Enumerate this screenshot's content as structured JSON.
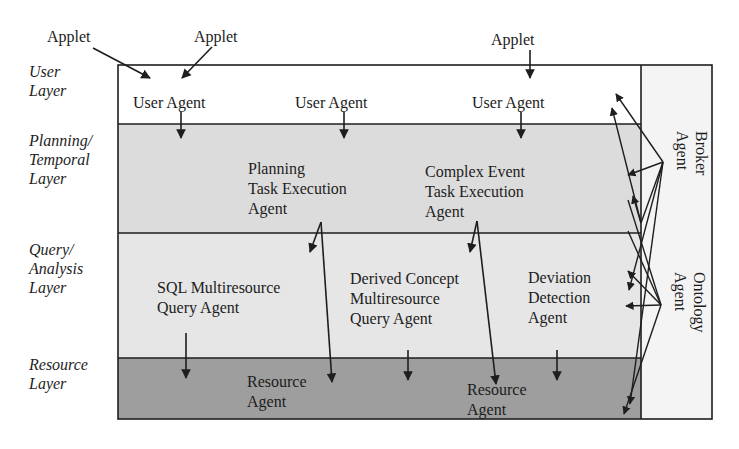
{
  "diagram": {
    "type": "layered-agent-architecture",
    "applets": [
      {
        "label": "Applet"
      },
      {
        "label": "Applet"
      },
      {
        "label": "Applet"
      }
    ],
    "layers": [
      {
        "id": "user",
        "label": "User\nLayer",
        "fill": "#ffffff"
      },
      {
        "id": "planning",
        "label": "Planning/\nTemporal\nLayer",
        "fill": "#dcdcdc"
      },
      {
        "id": "query",
        "label": "Query/\nAnalysis\nLayer",
        "fill": "#e4e4e4"
      },
      {
        "id": "resource",
        "label": "Resource\nLayer",
        "fill": "#9c9c9c"
      }
    ],
    "agents": {
      "user_agent_1": "User Agent",
      "user_agent_2": "User Agent",
      "user_agent_3": "User Agent",
      "planning_agent": "Planning\nTask Execution\nAgent",
      "complex_event_agent": "Complex Event\nTask Execution\nAgent",
      "sql_agent": "SQL Multiresource\nQuery Agent",
      "derived_concept_agent": "Derived Concept\nMultiresource\nQuery Agent",
      "deviation_agent": "Deviation\nDetection\nAgent",
      "resource_agent_1": "Resource\nAgent",
      "resource_agent_2": "Resource\nAgent"
    },
    "side_column": {
      "broker": "Broker\nAgent",
      "ontology": "Ontology\nAgent",
      "fill": "#f4f4f4"
    },
    "colors": {
      "line": "#1e1e1e"
    }
  }
}
